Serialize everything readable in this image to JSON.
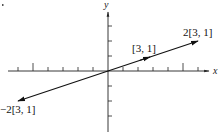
{
  "diagram": {
    "type": "vector-plot",
    "axes": {
      "x_label": "x",
      "y_label": "y"
    },
    "unit_px": 15,
    "origin_px": [
      108,
      71
    ],
    "x_ticks": [
      -6,
      -5,
      -4,
      -3,
      -2,
      -1,
      1,
      2,
      3,
      4,
      5,
      6
    ],
    "major_x_ticks": [
      -5,
      5
    ],
    "y_ticks": [
      -3,
      -2,
      -1,
      1,
      2,
      3
    ],
    "vectors": [
      {
        "label": "[3, 1]",
        "components": [
          3,
          1
        ]
      },
      {
        "label": "2[3, 1]",
        "components": [
          6,
          2
        ]
      },
      {
        "label": "−2[3, 1]",
        "components": [
          -6,
          -2
        ]
      }
    ]
  },
  "labels": {
    "v1": "[3, 1]",
    "v2": "2[3, 1]",
    "v3": "−2[3, 1]",
    "x": "x",
    "y": "y"
  },
  "colors": {
    "ink": "#111111",
    "background": "#ffffff"
  }
}
